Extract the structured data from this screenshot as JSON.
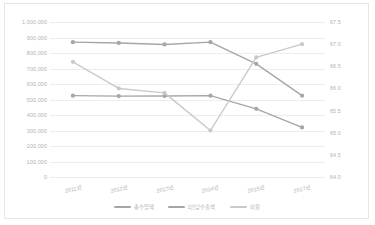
{
  "chart_data": {
    "type": "line",
    "title": "",
    "xlabel": "",
    "ylabel": "",
    "grid": true,
    "legend_position": "bottom",
    "categories": [
      "2011년",
      "2012년",
      "2013년",
      "2014년",
      "2015년",
      "2017년"
    ],
    "y_left": {
      "min": 0,
      "max": 1000000,
      "step": 100000,
      "ticks": [
        "1,000,000",
        "900,000",
        "800,000",
        "700,000",
        "600,000",
        "500,000",
        "400,000",
        "300,000",
        "200,000",
        "100,000",
        "0"
      ],
      "tick_values": [
        1000000,
        900000,
        800000,
        700000,
        600000,
        500000,
        400000,
        300000,
        200000,
        100000,
        0
      ]
    },
    "y_right": {
      "min": 64.0,
      "max": 67.5,
      "step": 0.5,
      "ticks": [
        "67.5",
        "67.0",
        "66.5",
        "66.0",
        "65.5",
        "65.0",
        "64.5",
        "64.0"
      ],
      "tick_values": [
        67.5,
        67.0,
        66.5,
        66.0,
        65.5,
        65.0,
        64.5,
        64.0
      ]
    },
    "series": [
      {
        "name": "총수입액",
        "axis": "left",
        "color": "#a6a6a6",
        "values": [
          870000,
          865000,
          855000,
          870000,
          730000,
          525000
        ]
      },
      {
        "name": "1인당수출액",
        "axis": "left",
        "color": "#a6a6a6",
        "values": [
          525000,
          522000,
          523000,
          525000,
          440000,
          320000
        ]
      },
      {
        "name": "비율",
        "axis": "right",
        "color": "#c9c9c9",
        "values": [
          66.6,
          66.0,
          65.9,
          65.05,
          66.7,
          67.0
        ]
      }
    ]
  },
  "colors": {
    "grid": "#ededed",
    "border": "#e6e6e6",
    "tick_text": "#b2b2b2",
    "series_1": "#a6a6a6",
    "series_2": "#a6a6a6",
    "series_3": "#c9c9c9"
  }
}
